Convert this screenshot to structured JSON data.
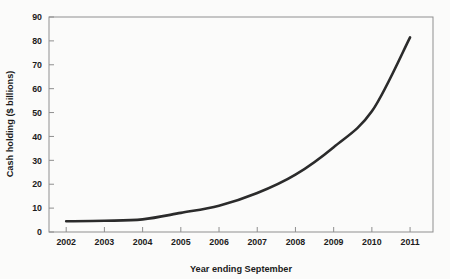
{
  "chart_data": {
    "type": "line",
    "title": "",
    "subtitle": "",
    "xlabel": "Year ending September",
    "ylabel": "Cash holding ($ billions)",
    "x": [
      2002,
      2003,
      2004,
      2005,
      2006,
      2007,
      2008,
      2009,
      2010,
      2011
    ],
    "xtick_labels": [
      "2002",
      "2003",
      "2004",
      "2005",
      "2006",
      "2007",
      "2008",
      "2009",
      "2010",
      "2011"
    ],
    "ytick_labels": [
      "0",
      "10",
      "20",
      "30",
      "40",
      "50",
      "60",
      "70",
      "80",
      "90"
    ],
    "yticks": [
      0,
      10,
      20,
      30,
      40,
      50,
      60,
      70,
      80,
      90
    ],
    "values": [
      4.5,
      4.7,
      5.3,
      8.0,
      11.0,
      16.3,
      24.0,
      35.5,
      50.5,
      81.5
    ],
    "series": [
      {
        "name": "Cash holding",
        "values": [
          4.5,
          4.7,
          5.3,
          8.0,
          11.0,
          16.3,
          24.0,
          35.5,
          50.5,
          81.5
        ]
      }
    ],
    "xlim": [
      2001.55,
      2011.6
    ],
    "ylim": [
      0,
      90
    ],
    "grid": false,
    "legend": false,
    "legend_position": "none",
    "line_color": "#2b2b2b",
    "frame_color": "#8a8a8a",
    "annotations": []
  }
}
